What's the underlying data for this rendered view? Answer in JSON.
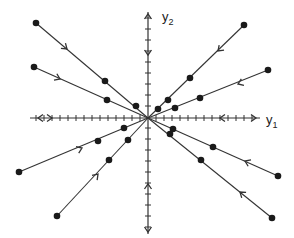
{
  "diagram": {
    "type": "phase-portrait",
    "origin": [
      148,
      118
    ],
    "axes": {
      "x": {
        "label_base": "y",
        "label_sub": "1",
        "from": 30,
        "to": 260,
        "label_pos": [
          266,
          113
        ]
      },
      "y": {
        "label_base": "y",
        "label_sub": "2",
        "from": 12,
        "to": 234,
        "label_pos": [
          162,
          10
        ]
      }
    },
    "colors": {
      "line": "#333333",
      "dot": "#1a1a1a",
      "axis": "#333333"
    },
    "trajectories": [
      {
        "name": "upper-left-steep",
        "start": [
          36,
          23
        ],
        "dots": [
          [
            36,
            23
          ],
          [
            105,
            81
          ],
          [
            136,
            106
          ]
        ],
        "arrow": [
          67,
          49
        ]
      },
      {
        "name": "upper-left-shallow",
        "start": [
          34,
          67
        ],
        "dots": [
          [
            34,
            67
          ],
          [
            107,
            100
          ]
        ],
        "arrow": [
          60,
          79
        ]
      },
      {
        "name": "upper-right-steep",
        "start": [
          244,
          25
        ],
        "dots": [
          [
            244,
            25
          ],
          [
            190,
            78
          ],
          [
            168,
            100
          ],
          [
            158,
            109
          ]
        ],
        "arrow": [
          218,
          51
        ]
      },
      {
        "name": "upper-right-shallow",
        "start": [
          268,
          70
        ],
        "dots": [
          [
            268,
            70
          ],
          [
            200,
            98
          ],
          [
            175,
            108
          ]
        ],
        "arrow": [
          238,
          84
        ]
      },
      {
        "name": "lower-left-shallow",
        "start": [
          19,
          172
        ],
        "dots": [
          [
            19,
            172
          ],
          [
            98,
            141
          ],
          [
            124,
            128
          ]
        ],
        "arrow": [
          82,
          148
        ]
      },
      {
        "name": "lower-left-steep",
        "start": [
          57,
          216
        ],
        "dots": [
          [
            57,
            216
          ],
          [
            109,
            160
          ],
          [
            128,
            140
          ]
        ],
        "arrow": [
          98,
          174
        ]
      },
      {
        "name": "lower-right-shallow",
        "start": [
          278,
          176
        ],
        "dots": [
          [
            278,
            176
          ],
          [
            213,
            147
          ],
          [
            173,
            129
          ]
        ],
        "arrow": [
          245,
          161
        ]
      },
      {
        "name": "lower-right-steep",
        "start": [
          272,
          218
        ],
        "dots": [
          [
            272,
            218
          ],
          [
            201,
            160
          ],
          [
            170,
            134
          ]
        ],
        "arrow": [
          240,
          192
        ]
      }
    ],
    "axis_flow_arrows": {
      "x_left": [
        38,
        52
      ],
      "x_right": [
        220,
        256
      ],
      "y_top": [
        14,
        55
      ],
      "y_bottom": [
        184,
        232
      ]
    }
  }
}
